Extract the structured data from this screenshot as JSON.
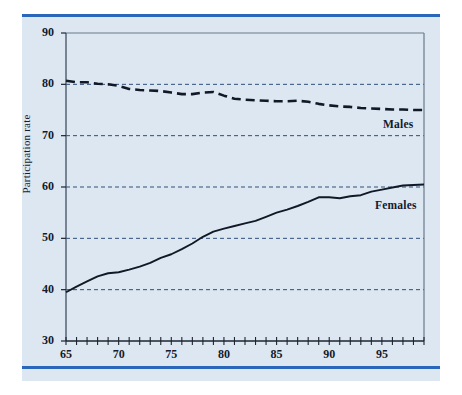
{
  "figure": {
    "background_color": "#dce7f1",
    "rule_color": "#2a66ba",
    "line_color": "#111827",
    "grid_color": "#2f4f7a",
    "axis_color": "#6b7a8c"
  },
  "axis": {
    "y_title": "Participation rate",
    "y_ticks": [
      "30",
      "40",
      "50",
      "60",
      "70",
      "80",
      "90"
    ],
    "x_ticks": [
      "65",
      "70",
      "75",
      "80",
      "85",
      "90",
      "95"
    ]
  },
  "labels": {
    "males": "Males",
    "females": "Females"
  },
  "chart_data": {
    "type": "line",
    "title": "",
    "xlabel": "",
    "ylabel": "Participation rate",
    "xlim": [
      65,
      99
    ],
    "ylim": [
      30,
      90
    ],
    "grid": true,
    "legend_position": "inline-right",
    "x": [
      65,
      66,
      67,
      68,
      69,
      70,
      71,
      72,
      73,
      74,
      75,
      76,
      77,
      78,
      79,
      80,
      81,
      82,
      83,
      84,
      85,
      86,
      87,
      88,
      89,
      90,
      91,
      92,
      93,
      94,
      95,
      96,
      97,
      98,
      99
    ],
    "series": [
      {
        "name": "Males",
        "style": "dashed",
        "values": [
          80.7,
          80.4,
          80.4,
          80.1,
          80.0,
          79.7,
          79.1,
          78.9,
          78.8,
          78.7,
          78.4,
          78.1,
          78.1,
          78.4,
          78.5,
          77.8,
          77.2,
          77.0,
          76.9,
          76.8,
          76.7,
          76.7,
          76.8,
          76.6,
          76.2,
          75.9,
          75.7,
          75.6,
          75.4,
          75.3,
          75.2,
          75.1,
          75.1,
          75.0,
          75.0
        ]
      },
      {
        "name": "Females",
        "style": "solid",
        "values": [
          39.5,
          40.6,
          41.6,
          42.6,
          43.2,
          43.4,
          43.9,
          44.5,
          45.2,
          46.2,
          46.9,
          47.9,
          49.0,
          50.3,
          51.3,
          51.9,
          52.4,
          52.9,
          53.4,
          54.2,
          55.0,
          55.6,
          56.3,
          57.1,
          58.0,
          58.0,
          57.8,
          58.2,
          58.4,
          59.1,
          59.5,
          59.9,
          60.3,
          60.4,
          60.5
        ]
      }
    ]
  }
}
